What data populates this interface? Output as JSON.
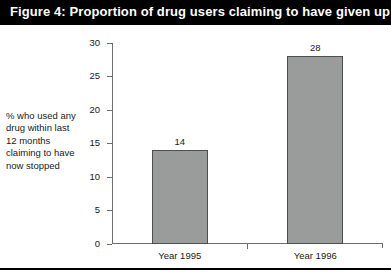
{
  "figure": {
    "title": "Figure 4: Proportion of drug users claiming to have given up",
    "title_bar_color": "#000000",
    "title_text_color": "#ffffff",
    "background_color": "#ffffff"
  },
  "axis_caption_lines": [
    "% who used any",
    "drug within last",
    "12 months",
    "claiming to have",
    "now stopped"
  ],
  "chart_data": {
    "type": "bar",
    "title": "Figure 4: Proportion of drug users claiming to have given up",
    "categories": [
      "Year 1995",
      "Year 1996"
    ],
    "values": [
      14,
      28
    ],
    "data_labels": [
      "14",
      "28"
    ],
    "xlabel": "",
    "ylabel": "% who used any drug within last 12 months claiming to have now stopped",
    "ylim": [
      0,
      30
    ],
    "ytick_labels": [
      "0",
      "5",
      "10",
      "15",
      "20",
      "25",
      "30"
    ],
    "ytick_values": [
      0,
      5,
      10,
      15,
      20,
      25,
      30
    ],
    "grid": false,
    "legend": false,
    "bar_fill_color": "#9a9b9b",
    "bar_border_color": "#4f4f4f",
    "axis_color": "#6e6e6e"
  }
}
